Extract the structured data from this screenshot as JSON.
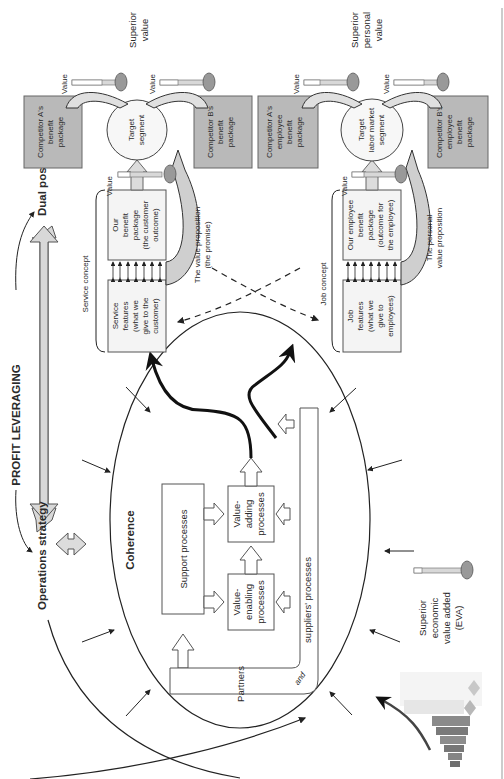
{
  "diagram": {
    "orientation": "rotated -90deg (text reads bottom-to-top)",
    "title_left": "PROFIT LEVERAGING",
    "left_labels": {
      "operations_strategy": "Operations strategy",
      "dual_positioning": "Dual positioning"
    },
    "coherence": {
      "label": "Coherence",
      "support_processes": "Support processes",
      "value_enabling": [
        "Value-",
        "enabling",
        "processes"
      ],
      "value_adding": [
        "Value-",
        "adding",
        "processes"
      ],
      "partners_1": "Partners",
      "partners_2": "and",
      "partners_3": "suppliers' processes"
    },
    "service": {
      "concept_label": "Service concept",
      "features": [
        "Service",
        "features",
        "(what we",
        "give to the",
        "customer)"
      ],
      "benefit": [
        "Our",
        "benefit",
        "package",
        "(the customer",
        "outcome)"
      ],
      "value_label": "Value",
      "target": [
        "Target",
        "segment"
      ],
      "proposition": [
        "The value proposition",
        "(the promise)"
      ],
      "competitor_a": [
        "Competitor A's",
        "benefit",
        "package"
      ],
      "competitor_b": [
        "Competitor B's",
        "benefit",
        "package"
      ],
      "value_a": "Value",
      "value_b": "Value",
      "superior": [
        "Superior",
        "value"
      ]
    },
    "job": {
      "concept_label": "Job concept",
      "features": [
        "Job",
        "features",
        "(what we",
        "give to",
        "employees)"
      ],
      "benefit": [
        "Our employee",
        "benefit",
        "package",
        "(outcome for",
        "the employee)"
      ],
      "value_label": "Value",
      "target": [
        "Target",
        "labor market",
        "segment"
      ],
      "proposition": [
        "The personal",
        "value proposition"
      ],
      "competitor_a": [
        "Competitor A's",
        "employee",
        "benefit",
        "package"
      ],
      "competitor_b": [
        "Competitor B's",
        "employee",
        "benefit",
        "package"
      ],
      "value_a": "Value",
      "value_b": "Value",
      "superior": [
        "Superior",
        "personal",
        "value"
      ]
    },
    "eva": [
      "Superior",
      "economic",
      "value added",
      "(EVA)"
    ],
    "colors": {
      "gray_box": "#b9b9b9",
      "light_box": "#f4f4f4",
      "ink": "#222222",
      "arrow_fill": "#d8d8d8"
    }
  }
}
